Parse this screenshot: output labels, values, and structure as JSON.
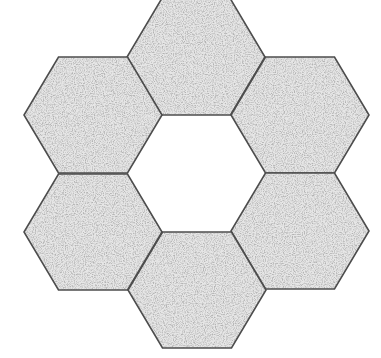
{
  "figure": {
    "background": "#ffffff",
    "outline_color": "#4d4d4d",
    "fill_texture": "speckled-gray",
    "hex_side": 69,
    "hex_half_height": 58,
    "center_hole": {
      "cx": 196,
      "cy": 173
    },
    "hexagons": [
      {
        "name": "top",
        "cx": 196,
        "cy": 57
      },
      {
        "name": "top-right",
        "cx": 300,
        "cy": 115
      },
      {
        "name": "bottom-right",
        "cx": 300,
        "cy": 231
      },
      {
        "name": "bottom",
        "cx": 197,
        "cy": 290
      },
      {
        "name": "bottom-left",
        "cx": 93,
        "cy": 232
      },
      {
        "name": "top-left",
        "cx": 93,
        "cy": 115
      }
    ]
  }
}
